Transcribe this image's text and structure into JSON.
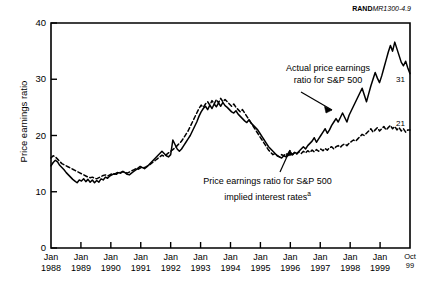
{
  "credit": {
    "bold": "RAND",
    "italic": "MR1300-4.9"
  },
  "axes": {
    "ylabel": "Price earnings ratio",
    "yticks": [
      "0",
      "10",
      "20",
      "30",
      "40"
    ],
    "xticks": [
      {
        "top": "Jan",
        "bottom": "1988"
      },
      {
        "top": "Jan",
        "bottom": "1989"
      },
      {
        "top": "Jan",
        "bottom": "1990"
      },
      {
        "top": "Jan",
        "bottom": "1991"
      },
      {
        "top": "Jan",
        "bottom": "1992"
      },
      {
        "top": "Jan",
        "bottom": "1993"
      },
      {
        "top": "Jan",
        "bottom": "1994"
      },
      {
        "top": "Jan",
        "bottom": "1995"
      },
      {
        "top": "Jan",
        "bottom": "1996"
      },
      {
        "top": "Jan",
        "bottom": "1997"
      },
      {
        "top": "Jan",
        "bottom": "1998"
      },
      {
        "top": "Jan",
        "bottom": "1999"
      },
      {
        "top": "Oct",
        "bottom": "99"
      }
    ]
  },
  "annotations": {
    "actual_line1": "Actual price earnings",
    "actual_line2": "ratio for S&P 500",
    "implied_line1": "Price earnings ratio for S&P 500",
    "implied_line2": "implied interest rates",
    "implied_footnote": "a",
    "end_actual": "31",
    "end_implied": "21"
  },
  "chart_data": {
    "type": "line",
    "title": "",
    "xlabel": "",
    "ylabel": "Price earnings ratio",
    "ylim": [
      0,
      40
    ],
    "yticks": [
      0,
      10,
      20,
      30,
      40
    ],
    "grid": false,
    "legend": "annotations-inline",
    "x_start": "Jan 1988",
    "x_end": "Oct 1999",
    "x_tick_labels": [
      "Jan 1988",
      "Jan 1989",
      "Jan 1990",
      "Jan 1991",
      "Jan 1992",
      "Jan 1993",
      "Jan 1994",
      "Jan 1995",
      "Jan 1996",
      "Jan 1997",
      "Jan 1998",
      "Jan 1999",
      "Oct 99"
    ],
    "series": [
      {
        "name": "Actual price earnings ratio for S&P 500",
        "style": "solid",
        "end_label": "31",
        "values": [
          14.6,
          15.2,
          15.6,
          15.3,
          14.7,
          14.3,
          13.9,
          13.4,
          13.0,
          12.6,
          12.2,
          11.9,
          11.6,
          12.1,
          11.9,
          12.3,
          11.8,
          12.2,
          11.7,
          12.1,
          11.6,
          12.0,
          11.7,
          12.3,
          12.1,
          12.6,
          12.4,
          12.8,
          13.0,
          13.2,
          13.1,
          13.4,
          13.3,
          13.6,
          13.4,
          13.1,
          13.0,
          13.3,
          13.6,
          13.9,
          14.2,
          14.5,
          14.3,
          14.1,
          14.4,
          14.8,
          15.2,
          15.6,
          16.0,
          16.4,
          16.8,
          17.2,
          16.8,
          16.4,
          16.2,
          16.6,
          19.2,
          18.4,
          17.6,
          17.2,
          17.6,
          18.2,
          18.8,
          19.4,
          20.0,
          20.8,
          21.6,
          22.4,
          23.4,
          24.2,
          24.8,
          25.2,
          24.6,
          25.4,
          24.8,
          25.6,
          25.1,
          25.8,
          25.2,
          25.9,
          25.3,
          25.0,
          24.6,
          24.2,
          24.0,
          24.4,
          23.8,
          23.4,
          23.0,
          22.6,
          22.3,
          22.8,
          22.2,
          21.8,
          21.4,
          21.0,
          20.4,
          19.8,
          19.2,
          18.6,
          18.0,
          17.6,
          17.2,
          16.8,
          16.4,
          16.2,
          16.0,
          16.4,
          16.2,
          16.6,
          17.0,
          16.6,
          17.0,
          16.8,
          17.2,
          17.6,
          18.0,
          17.6,
          18.2,
          18.6,
          19.0,
          19.6,
          18.8,
          19.4,
          20.0,
          20.6,
          21.2,
          20.4,
          21.0,
          21.8,
          22.4,
          23.0,
          22.4,
          23.2,
          24.0,
          23.2,
          22.4,
          23.6,
          24.4,
          25.2,
          26.0,
          26.8,
          27.6,
          28.4,
          27.2,
          26.0,
          27.4,
          28.8,
          30.0,
          31.2,
          30.2,
          29.4,
          30.6,
          32.0,
          33.4,
          34.8,
          36.0,
          35.0,
          36.6,
          35.4,
          34.2,
          33.0,
          32.4,
          33.2,
          32.0,
          31.0
        ]
      },
      {
        "name": "Price earnings ratio for S&P 500 implied interest rates",
        "style": "dashed",
        "end_label": "21",
        "values": [
          16.0,
          16.4,
          16.2,
          15.8,
          15.4,
          15.0,
          14.8,
          14.6,
          14.4,
          14.2,
          14.0,
          13.8,
          13.6,
          13.4,
          13.2,
          13.0,
          12.8,
          12.6,
          12.5,
          12.6,
          12.4,
          12.3,
          12.5,
          12.7,
          12.9,
          13.0,
          12.8,
          13.0,
          13.2,
          13.1,
          13.3,
          13.5,
          13.4,
          13.6,
          13.5,
          13.3,
          13.5,
          13.7,
          13.9,
          14.1,
          14.0,
          14.2,
          14.4,
          14.3,
          14.5,
          14.7,
          15.0,
          15.3,
          15.6,
          15.9,
          16.2,
          16.5,
          16.3,
          16.6,
          16.9,
          17.2,
          17.5,
          17.8,
          18.2,
          18.6,
          19.0,
          19.6,
          20.2,
          20.8,
          21.6,
          22.4,
          23.2,
          24.0,
          24.8,
          25.4,
          25.0,
          25.6,
          26.0,
          25.4,
          26.2,
          25.6,
          26.4,
          25.8,
          26.6,
          26.0,
          26.4,
          26.0,
          25.6,
          25.2,
          25.6,
          25.0,
          24.6,
          24.2,
          24.6,
          24.0,
          23.4,
          22.8,
          22.2,
          21.6,
          21.0,
          20.4,
          19.8,
          19.2,
          18.6,
          18.0,
          17.4,
          17.0,
          16.6,
          16.8,
          16.4,
          16.2,
          16.6,
          16.4,
          16.8,
          16.5,
          16.9,
          16.6,
          17.0,
          16.7,
          17.1,
          16.8,
          17.2,
          16.9,
          17.3,
          17.0,
          17.4,
          17.1,
          17.5,
          17.2,
          17.6,
          17.3,
          17.7,
          17.4,
          17.8,
          18.0,
          17.6,
          18.0,
          18.2,
          17.9,
          18.3,
          18.5,
          18.2,
          18.6,
          18.9,
          19.2,
          19.0,
          19.4,
          19.8,
          20.2,
          20.0,
          20.4,
          20.8,
          21.2,
          20.6,
          21.0,
          21.4,
          20.8,
          21.2,
          21.6,
          21.0,
          21.4,
          21.8,
          21.2,
          21.6,
          21.0,
          21.4,
          20.8,
          21.2,
          20.6,
          21.0,
          21.0
        ]
      }
    ]
  },
  "plot": {
    "left": 51,
    "right": 410,
    "top": 23,
    "bottom": 248
  }
}
